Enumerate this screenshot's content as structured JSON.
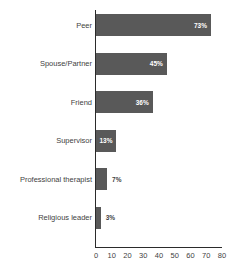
{
  "chart_data": {
    "type": "bar",
    "orientation": "horizontal",
    "title": "",
    "title_visible": false,
    "title_note": "cropped off at top edge of image",
    "xlabel": "",
    "ylabel": "",
    "xlim": [
      0,
      80
    ],
    "xticks": [
      0,
      10,
      20,
      30,
      40,
      50,
      60,
      70,
      80
    ],
    "xtick_labels": [
      "0",
      "10",
      "20",
      "30",
      "40",
      "50",
      "60",
      "70",
      "80"
    ],
    "grid": false,
    "legend": false,
    "bar_color": "#595959",
    "axis_color": "#2b2b2b",
    "label_color": "#3f3f3f",
    "value_suffix": "%",
    "categories": [
      "Peer",
      "Spouse/Partner",
      "Friend",
      "Supervisor",
      "Professional therapist",
      "Religious leader"
    ],
    "values": [
      73,
      45,
      36,
      13,
      7,
      3
    ],
    "data_labels": [
      "73%",
      "45%",
      "36%",
      "13%",
      "7%",
      "3%"
    ],
    "label_placement": [
      "inside",
      "inside",
      "inside",
      "inside",
      "outside",
      "outside"
    ]
  }
}
